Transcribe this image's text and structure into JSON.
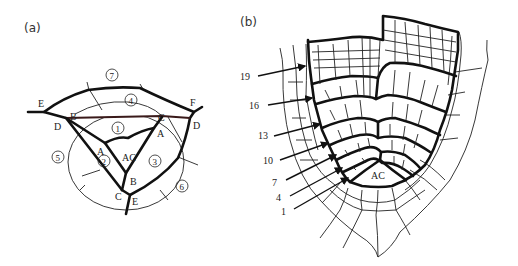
{
  "figure": {
    "panels": [
      {
        "id": "a",
        "label": "(a)",
        "description": "Schematic of apical cell division pattern with segments",
        "vertex_labels": {
          "E_left": "E",
          "F": "F",
          "B_top": "B",
          "D_left": "D",
          "C_top": "C",
          "D_right": "D",
          "A_left": "A",
          "A_right": "A",
          "AC": "AC",
          "B_bottom": "B",
          "C_bottom": "C",
          "E_bottom": "E"
        },
        "segment_labels": [
          "1",
          "2",
          "3",
          "4",
          "5",
          "6",
          "7"
        ]
      },
      {
        "id": "b",
        "label": "(b)",
        "description": "Cell pattern drawing of shoot apex with numbered segment arrows",
        "center_label": "AC",
        "arrow_labels": [
          "19",
          "16",
          "13",
          "10",
          "7",
          "4",
          "1"
        ]
      }
    ]
  }
}
